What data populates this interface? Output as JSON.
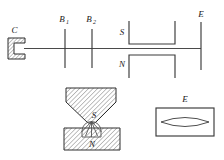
{
  "figure": {
    "title": "",
    "background_color": "#ffffff",
    "line_color": "#4a4a4a",
    "hatch_color": "#555555",
    "label_color": "#1a1a1a",
    "width": 224,
    "height": 160
  },
  "top_diagram": {
    "name": "schematic-beamline",
    "axis_label": "",
    "components": [
      {
        "id": "C",
        "label": "C",
        "type": "c-shaped-hatched-bracket",
        "description": "Hatched C-shaped clamp at left end of horizontal axis"
      },
      {
        "id": "B1",
        "label": "B",
        "subscript": "1",
        "type": "vertical-tick",
        "description": "First vertical tick crossing the axis"
      },
      {
        "id": "B2",
        "label": "B",
        "subscript": "2",
        "type": "vertical-tick",
        "description": "Second vertical tick crossing the axis"
      },
      {
        "id": "S",
        "label": "S",
        "type": "bracket-open-up",
        "description": "U-shaped pole piece above the axis"
      },
      {
        "id": "N",
        "label": "N",
        "type": "bracket-open-down",
        "description": "Inverted U-shaped pole piece below the axis"
      },
      {
        "id": "E",
        "label": "E",
        "type": "vertical-line",
        "description": "Vertical line at right end of the axis"
      }
    ]
  },
  "detail_left": {
    "name": "detail-pole-gap",
    "labels": {
      "upper": "S",
      "lower": "N"
    },
    "parts": [
      {
        "id": "upper-wedge",
        "label": "S",
        "fill": "hatched",
        "description": "Hatched tapering wedge pointing down"
      },
      {
        "id": "lower-block",
        "label": "N",
        "fill": "hatched",
        "description": "Hatched rectangular block below"
      },
      {
        "id": "arc-dome",
        "label": "",
        "fill": "none",
        "description": "Dome with radiating lines in the gap"
      }
    ]
  },
  "detail_right": {
    "name": "detail-aperture",
    "label": "E",
    "parts": [
      {
        "id": "frame",
        "label": "",
        "description": "Rectangular frame"
      },
      {
        "id": "lens-shape",
        "label": "",
        "description": "Lenticular (lens) shape inside frame"
      }
    ]
  }
}
